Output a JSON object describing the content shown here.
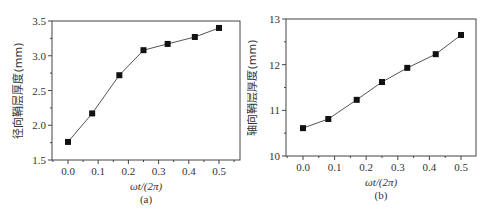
{
  "chart_data": [
    {
      "type": "line",
      "panel": "(a)",
      "title": "",
      "xlabel": "ωt/(2π)",
      "ylabel": "径向鞘层厚度(mm)",
      "x": [
        0.0,
        0.08,
        0.17,
        0.25,
        0.33,
        0.42,
        0.5
      ],
      "series": [
        {
          "name": "径向鞘层厚度",
          "marker": "square",
          "values": [
            1.76,
            2.17,
            2.72,
            3.08,
            3.17,
            3.27,
            3.4
          ]
        }
      ],
      "xlim": [
        -0.06,
        0.55
      ],
      "ylim": [
        1.5,
        3.5
      ],
      "xticks": [
        "0.0",
        "0.1",
        "0.2",
        "0.3",
        "0.4",
        "0.5"
      ],
      "yticks": [
        "1.5",
        "2.0",
        "2.5",
        "3.0",
        "3.5"
      ],
      "grid": false,
      "legend": null
    },
    {
      "type": "line",
      "panel": "(b)",
      "title": "",
      "xlabel": "ωt/(2π)",
      "ylabel": "轴向鞘层厚度(mm)",
      "x": [
        0.0,
        0.08,
        0.17,
        0.25,
        0.33,
        0.42,
        0.5
      ],
      "series": [
        {
          "name": "轴向鞘层厚度",
          "marker": "square",
          "values": [
            10.61,
            10.81,
            11.23,
            11.62,
            11.93,
            12.23,
            12.65
          ]
        }
      ],
      "xlim": [
        -0.05,
        0.55
      ],
      "ylim": [
        10,
        13
      ],
      "xticks": [
        "0.0",
        "0.1",
        "0.2",
        "0.3",
        "0.4",
        "0.5"
      ],
      "yticks": [
        "10",
        "11",
        "12",
        "13"
      ],
      "grid": false,
      "legend": null
    }
  ],
  "panels": {
    "a": {
      "caption": "(a)",
      "xlabel": "ωt/(2π)",
      "ylabel": "径向鞘层厚度(mm)"
    },
    "b": {
      "caption": "(b)",
      "xlabel": "ωt/(2π)",
      "ylabel": "轴向鞘层厚度(mm)"
    }
  },
  "colors": {
    "line": "#555555",
    "marker": "#111111",
    "axis": "#444444"
  }
}
